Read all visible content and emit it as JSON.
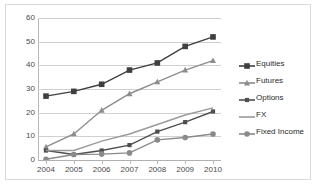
{
  "chart_data": {
    "type": "line",
    "title": "",
    "subtitle": "",
    "xlabel": "",
    "ylabel": "",
    "categories": [
      "2004",
      "2005",
      "2006",
      "2007",
      "2008",
      "2009",
      "2010"
    ],
    "x": [
      2004,
      2005,
      2006,
      2007,
      2008,
      2009,
      2010
    ],
    "ylim": [
      0,
      60
    ],
    "yticks": [
      0,
      10,
      20,
      30,
      40,
      50,
      60
    ],
    "ytick_labels": [
      "0",
      "10",
      "20",
      "30",
      "40",
      "50",
      "60"
    ],
    "grid": true,
    "legend_position": "right",
    "series": [
      {
        "name": "Equities",
        "values": [
          27,
          29,
          32,
          38,
          41,
          48,
          52
        ],
        "color": "#3f3f3f",
        "marker": "square"
      },
      {
        "name": "Futures",
        "values": [
          5.5,
          11,
          21,
          28,
          33,
          38,
          42
        ],
        "color": "#8d8d8d",
        "marker": "triangle"
      },
      {
        "name": "Options",
        "values": [
          4,
          2.3,
          4,
          6.3,
          12,
          16,
          20.5
        ],
        "color": "#4f4f4f",
        "marker": "square-small"
      },
      {
        "name": "FX",
        "values": [
          4,
          4,
          8,
          11,
          15,
          19,
          22
        ],
        "color": "#9a9a9a",
        "marker": "none"
      },
      {
        "name": "Fixed Income",
        "values": [
          0.3,
          2.3,
          2.5,
          3,
          8.5,
          9.5,
          11
        ],
        "color": "#8a8a8a",
        "marker": "circle"
      }
    ]
  },
  "legend": {
    "items": [
      {
        "label": "Equities"
      },
      {
        "label": "Futures"
      },
      {
        "label": "Options"
      },
      {
        "label": "FX"
      },
      {
        "label": "Fixed Income"
      }
    ]
  }
}
